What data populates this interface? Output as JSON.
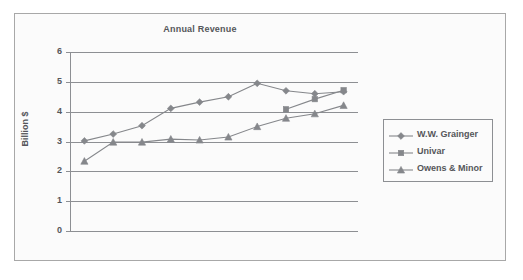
{
  "chart_data": {
    "type": "line",
    "title": "Annual Revenue",
    "xlabel": "",
    "ylabel": "Billion $",
    "categories": [
      "1994",
      "1995",
      "1996",
      "1997",
      "1998",
      "1999",
      "2000",
      "2001",
      "2002",
      "2003"
    ],
    "x": [
      1994,
      1995,
      1996,
      1997,
      1998,
      1999,
      2000,
      2001,
      2002,
      2003
    ],
    "ylim": [
      0,
      6
    ],
    "yticks": [
      "0",
      "1",
      "2",
      "3",
      "4",
      "5",
      "6"
    ],
    "grid": true,
    "legend_position": "right-outside",
    "series": [
      {
        "name": "W.W. Grainger",
        "marker": "diamond",
        "color": "#85878b",
        "values": [
          3.02,
          3.25,
          3.53,
          4.11,
          4.32,
          4.5,
          4.95,
          4.7,
          4.6,
          4.67
        ]
      },
      {
        "name": "Univar",
        "marker": "square",
        "color": "#85878b",
        "values": [
          null,
          null,
          null,
          null,
          null,
          null,
          null,
          4.08,
          4.42,
          4.72
        ]
      },
      {
        "name": "Owens & Minor",
        "marker": "triangle",
        "color": "#85878b",
        "values": [
          2.34,
          2.98,
          2.98,
          3.08,
          3.05,
          3.15,
          3.5,
          3.78,
          3.93,
          4.21
        ]
      }
    ]
  },
  "legend": {
    "items": [
      {
        "label": "W.W. Grainger",
        "marker": "diamond"
      },
      {
        "label": "Univar",
        "marker": "square"
      },
      {
        "label": "Owens & Minor",
        "marker": "triangle"
      }
    ]
  },
  "colors": {
    "line": "#85878b",
    "axis": "#8d8f93",
    "text": "#55565a",
    "frame": "#a8a8a8",
    "background": "#fbfbfb"
  }
}
